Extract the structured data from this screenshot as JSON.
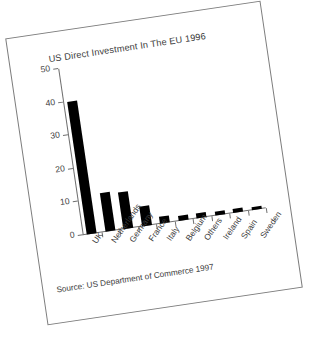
{
  "figure": {
    "source_note": "Source: US Department of Commerce 1997",
    "frame_color": "#7d7d7d",
    "bar_color": "#000000",
    "text_color": "#3c3c3c",
    "background": "#ffffff",
    "rotation_deg": -8.4
  },
  "chart_data": {
    "type": "bar",
    "title": "US Direct Investment In The EU 1996",
    "xlabel": "",
    "ylabel": "",
    "ylim": [
      0,
      50
    ],
    "yticks": [
      0,
      10,
      20,
      30,
      40,
      50
    ],
    "ytick_labels": [
      "0",
      "10",
      "20",
      "30",
      "40",
      "50"
    ],
    "grid": false,
    "legend": false,
    "categories": [
      "UK",
      "Netherlands",
      "Germany",
      "France",
      "Italy",
      "Belgium",
      "Others",
      "Ireland",
      "Spain",
      "Sweden"
    ],
    "values": [
      40,
      11.5,
      11,
      6,
      2,
      1.6,
      1.4,
      1.2,
      1.1,
      0.8
    ]
  }
}
